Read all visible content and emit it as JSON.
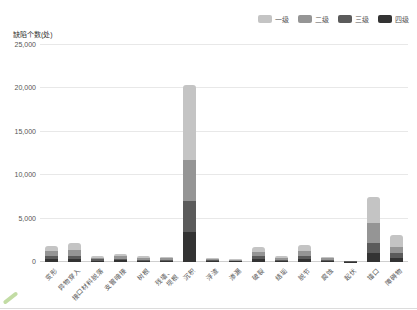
{
  "chart_data": {
    "type": "bar",
    "stacked": true,
    "title": "",
    "ylabel": "缺陷个数(处)",
    "xlabel": "",
    "ylim": [
      0,
      25000
    ],
    "yticks": [
      0,
      5000,
      10000,
      15000,
      20000,
      25000
    ],
    "grid": true,
    "legend_position": "top-right",
    "stack_order_bottom_to_top": [
      "四级",
      "三级",
      "二级",
      "一级"
    ],
    "categories": [
      "变形",
      "异物穿入",
      "接口材料脱落",
      "支管暗接",
      "树根",
      "残墙、\n坝根",
      "沉积",
      "浮渣",
      "渗漏",
      "破裂",
      "结垢",
      "脱节",
      "腐蚀",
      "起伏",
      "错口",
      "障碍物"
    ],
    "series": [
      {
        "name": "一级",
        "color": "#c4c4c4",
        "values": [
          600,
          800,
          150,
          250,
          200,
          150,
          8600,
          120,
          80,
          500,
          200,
          700,
          200,
          40,
          3000,
          1350
        ]
      },
      {
        "name": "二级",
        "color": "#959595",
        "values": [
          550,
          700,
          200,
          250,
          200,
          170,
          4800,
          130,
          90,
          500,
          200,
          600,
          180,
          40,
          2300,
          750
        ]
      },
      {
        "name": "三级",
        "color": "#5b5b5b",
        "values": [
          400,
          400,
          150,
          200,
          150,
          150,
          3500,
          100,
          70,
          400,
          130,
          400,
          130,
          35,
          1200,
          550
        ]
      },
      {
        "name": "四级",
        "color": "#333333",
        "values": [
          350,
          300,
          150,
          200,
          100,
          100,
          3500,
          100,
          60,
          300,
          120,
          300,
          110,
          35,
          1000,
          450
        ]
      }
    ],
    "totals": [
      1900,
      2200,
      650,
      900,
      650,
      570,
      20400,
      450,
      300,
      1700,
      650,
      2000,
      620,
      150,
      7500,
      3100
    ]
  },
  "colors": {
    "background": "#ffffff",
    "gridline": "#e8e8e8",
    "axis_text": "#555555",
    "watermark_green": "#8fbf5a"
  }
}
